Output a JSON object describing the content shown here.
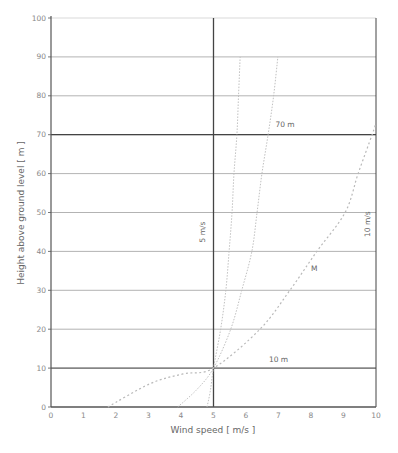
{
  "chart_data": {
    "type": "line",
    "title": "",
    "xlabel": "Wind speed [ m/s ]",
    "ylabel": "Height above ground level [ m ]",
    "xlim": [
      0,
      10
    ],
    "ylim": [
      0,
      100
    ],
    "x_ticks": [
      0,
      1,
      2,
      3,
      4,
      5,
      6,
      7,
      8,
      9,
      10
    ],
    "y_ticks": [
      0,
      10,
      20,
      30,
      40,
      50,
      60,
      70,
      80,
      90,
      100
    ],
    "grid": {
      "horizontal": true,
      "vertical": false
    },
    "reference_lines": [
      {
        "orientation": "horizontal",
        "value": 10,
        "label": "10 m"
      },
      {
        "orientation": "horizontal",
        "value": 70,
        "label": "70 m"
      },
      {
        "orientation": "vertical",
        "value": 5,
        "label": "5 m/s"
      },
      {
        "orientation": "vertical",
        "value": 10,
        "label": "10 m/s"
      }
    ],
    "series": [
      {
        "name": "Profile A (low shear)",
        "style": "dotted",
        "points": [
          [
            4.8,
            0
          ],
          [
            4.9,
            4
          ],
          [
            5.0,
            10
          ],
          [
            5.22,
            20
          ],
          [
            5.38,
            30
          ],
          [
            5.48,
            40
          ],
          [
            5.57,
            50
          ],
          [
            5.63,
            60
          ],
          [
            5.72,
            70
          ],
          [
            5.77,
            80
          ],
          [
            5.82,
            90
          ]
        ]
      },
      {
        "name": "Profile B (medium shear)",
        "style": "dotted",
        "points": [
          [
            3.9,
            0
          ],
          [
            4.5,
            4.6
          ],
          [
            5.0,
            10
          ],
          [
            5.53,
            20
          ],
          [
            5.87,
            30
          ],
          [
            6.18,
            40
          ],
          [
            6.34,
            50
          ],
          [
            6.49,
            60
          ],
          [
            6.68,
            70
          ],
          [
            6.85,
            80
          ],
          [
            6.98,
            90
          ]
        ]
      },
      {
        "name": "M",
        "style": "dashed",
        "points": [
          [
            1.75,
            0
          ],
          [
            3.05,
            6
          ],
          [
            4.06,
            8.5
          ],
          [
            5.0,
            10
          ],
          [
            6.43,
            20
          ],
          [
            7.35,
            30
          ],
          [
            8.18,
            40
          ],
          [
            9.05,
            50
          ],
          [
            9.45,
            60
          ],
          [
            9.88,
            70
          ],
          [
            10.0,
            73
          ]
        ]
      }
    ],
    "annotations": [
      {
        "text": "70 m",
        "x": 7.2,
        "y": 72
      },
      {
        "text": "10 m",
        "x": 7.0,
        "y": 11.5
      },
      {
        "text": "5 m/s",
        "x": 4.75,
        "y": 45,
        "rotation": -90
      },
      {
        "text": "10 m/s",
        "x": 9.8,
        "y": 47,
        "rotation": -90
      },
      {
        "text": "M",
        "x": 8.1,
        "y": 35
      }
    ],
    "legend": null
  },
  "colors": {
    "grid": "#a0a0a0",
    "grid_light": "#cfcfcf",
    "axis": "#555555",
    "emphasis": "#444444",
    "curve": "#b9b9b9",
    "text": "#777777"
  }
}
